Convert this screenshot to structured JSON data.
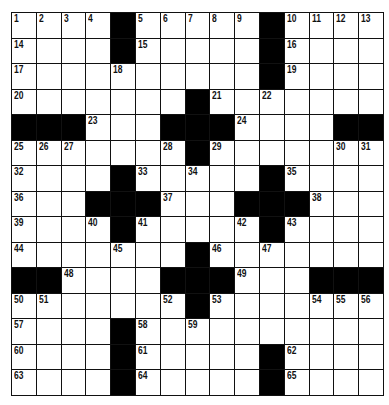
{
  "puzzle": {
    "rows": 15,
    "cols": 15,
    "grid": [
      [
        "1",
        "2",
        "3",
        "4",
        "#",
        "5",
        "6",
        "7",
        "8",
        "9",
        "#",
        "10",
        "11",
        "12",
        "13"
      ],
      [
        "14",
        "",
        "",
        "",
        "#",
        "15",
        "",
        "",
        "",
        "",
        "#",
        "16",
        "",
        "",
        ""
      ],
      [
        "17",
        "",
        "",
        "",
        "18",
        "",
        "",
        "",
        "",
        "",
        "#",
        "19",
        "",
        "",
        ""
      ],
      [
        "20",
        "",
        "",
        "",
        "",
        "",
        "",
        "#",
        "21",
        "",
        "22",
        "",
        "",
        "",
        ""
      ],
      [
        "#",
        "#",
        "#",
        "23",
        "",
        "",
        "#",
        "#",
        "#",
        "24",
        "",
        "",
        "",
        "#",
        "#"
      ],
      [
        "25",
        "26",
        "27",
        "",
        "",
        "",
        "28",
        "#",
        "29",
        "",
        "",
        "",
        "",
        "30",
        "31"
      ],
      [
        "32",
        "",
        "",
        "",
        "#",
        "33",
        "",
        "34",
        "",
        "",
        "#",
        "35",
        "",
        "",
        ""
      ],
      [
        "36",
        "",
        "",
        "#",
        "#",
        "#",
        "37",
        "",
        "",
        "#",
        "#",
        "#",
        "38",
        "",
        ""
      ],
      [
        "39",
        "",
        "",
        "40",
        "#",
        "41",
        "",
        "",
        "",
        "42",
        "#",
        "43",
        "",
        "",
        ""
      ],
      [
        "44",
        "",
        "",
        "",
        "45",
        "",
        "",
        "#",
        "46",
        "",
        "47",
        "",
        "",
        "",
        ""
      ],
      [
        "#",
        "#",
        "48",
        "",
        "",
        "",
        "#",
        "#",
        "#",
        "49",
        "",
        "",
        "#",
        "#",
        "#"
      ],
      [
        "50",
        "51",
        "",
        "",
        "",
        "",
        "52",
        "#",
        "53",
        "",
        "",
        "",
        "54",
        "55",
        "56"
      ],
      [
        "57",
        "",
        "",
        "",
        "#",
        "58",
        "",
        "59",
        "",
        "",
        "",
        "",
        "",
        "",
        ""
      ],
      [
        "60",
        "",
        "",
        "",
        "#",
        "61",
        "",
        "",
        "",
        "",
        "#",
        "62",
        "",
        "",
        ""
      ],
      [
        "63",
        "",
        "",
        "",
        "#",
        "64",
        "",
        "",
        "",
        "",
        "#",
        "65",
        "",
        "",
        ""
      ]
    ]
  }
}
